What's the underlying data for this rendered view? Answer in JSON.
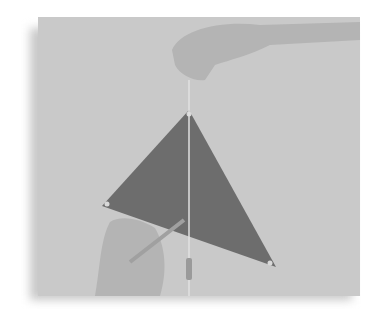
{
  "image": {
    "description": "Photograph of a dark gray triangle cutout hung from its top vertex by a string held by a hand, with a plumb line weight hanging down; a second hand holds a pencil near the lower-left vertex to trace the plumb line.",
    "colors": {
      "background": "#c9c9c9",
      "triangle": "#6d6d6d",
      "skin": "#b0b0b0",
      "string": "#e0e0e0"
    }
  }
}
